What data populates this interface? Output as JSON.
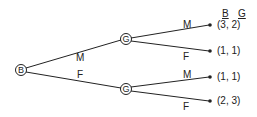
{
  "nodes": {
    "root": {
      "label": "B"
    },
    "top": {
      "label": "G"
    },
    "bottom": {
      "label": "G"
    }
  },
  "edges": {
    "root_top": "M",
    "root_bottom": "F",
    "top_1": "M",
    "top_2": "F",
    "bottom_1": "M",
    "bottom_2": "F"
  },
  "header": {
    "b": "B",
    "g": "G"
  },
  "payoffs": [
    "(3,  2)",
    "(1,  1)",
    "(1,  1)",
    "(2,  3)"
  ]
}
